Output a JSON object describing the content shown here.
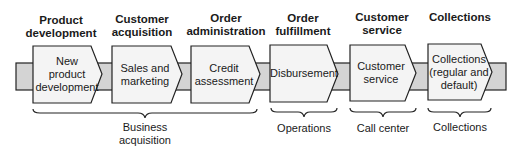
{
  "stages": [
    {
      "header": "Product\ndevelopment",
      "header_lines": [
        "Product",
        "development"
      ],
      "box_lines": [
        "New",
        "product",
        "development"
      ]
    },
    {
      "header_lines": [
        "Customer",
        "acquisition"
      ],
      "box_lines": [
        "Sales and",
        "marketing"
      ]
    },
    {
      "header_lines": [
        "Order",
        "administration"
      ],
      "box_lines": [
        "Credit",
        "assessment"
      ]
    },
    {
      "header_lines": [
        "Order",
        "fulfillment"
      ],
      "box_lines": [
        "Disbursement"
      ]
    },
    {
      "header_lines": [
        "Customer",
        "service"
      ],
      "box_lines": [
        "Customer",
        "service"
      ]
    },
    {
      "header_lines": [
        "Collections"
      ],
      "box_lines": [
        "Collections",
        "(regular and",
        "default)"
      ]
    }
  ],
  "groups": [
    {
      "lines": [
        "Business",
        "acquisition"
      ]
    },
    {
      "lines": [
        "Operations"
      ]
    },
    {
      "lines": [
        "Call center"
      ]
    },
    {
      "lines": [
        "Collections"
      ]
    }
  ],
  "colors": {
    "band": "#d4d4d4",
    "box": "#f4f4f4",
    "stroke": "#222222"
  }
}
